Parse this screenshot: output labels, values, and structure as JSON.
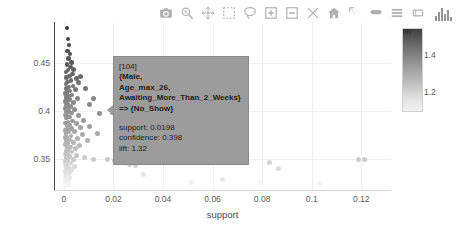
{
  "modebar": {
    "buttons": [
      {
        "name": "download-plot-camera-icon",
        "label": "Download plot as a png"
      },
      {
        "name": "zoom-icon",
        "label": "Zoom"
      },
      {
        "name": "pan-icon",
        "label": "Pan"
      },
      {
        "name": "box-select-icon",
        "label": "Box Select"
      },
      {
        "name": "lasso-select-icon",
        "label": "Lasso Select"
      },
      {
        "name": "zoom-in-icon",
        "label": "Zoom in"
      },
      {
        "name": "zoom-out-icon",
        "label": "Zoom out"
      },
      {
        "name": "autoscale-icon",
        "label": "Autoscale"
      },
      {
        "name": "reset-axes-home-icon",
        "label": "Reset axes"
      },
      {
        "name": "toggle-spike-lines-icon",
        "label": "Toggle Spike Lines"
      },
      {
        "name": "hover-closest-icon",
        "label": "Show closest data on hover"
      },
      {
        "name": "hover-compare-icon",
        "label": "Compare data on hover"
      },
      {
        "name": "toggle-drag-icon",
        "label": "Toggle drag"
      }
    ],
    "logo_label": "Produced with Plotly"
  },
  "tooltip": {
    "id": "[104]",
    "rule_lines": [
      "{Male,",
      "Age_max_26,",
      "Awaiting_More_Than_2_Weeks}",
      "=> {No_Show}"
    ],
    "stats": [
      "support: 0.0198",
      "confidence: 0.398",
      "lift: 1.32"
    ]
  },
  "chart_data": {
    "type": "scatter",
    "title": "",
    "xlabel": "support",
    "ylabel": "confidence",
    "xlim": [
      -0.004,
      0.132
    ],
    "ylim": [
      0.318,
      0.492
    ],
    "xticks": [
      "0",
      "0.02",
      "0.04",
      "0.06",
      "0.08",
      "0.1",
      "0.12"
    ],
    "xtickvals": [
      0,
      0.02,
      0.04,
      0.06,
      0.08,
      0.1,
      0.12
    ],
    "yticks": [
      "0.45",
      "0.4",
      "0.35"
    ],
    "ytickvals": [
      0.45,
      0.4,
      0.35
    ],
    "grid": true,
    "colorbar": {
      "title": "lift",
      "ticks": [
        "1.4",
        "1.2"
      ],
      "tickvals": [
        1.4,
        1.2
      ],
      "min": 1.1,
      "max": 1.55,
      "colorscale": "grey-dark-to-light"
    },
    "legend_position": "none",
    "color_by": "lift",
    "highlighted_point": {
      "support": 0.0198,
      "confidence": 0.398,
      "lift": 1.32
    },
    "points": [
      {
        "x": 0.0012,
        "y": 0.4855,
        "lift": 1.52
      },
      {
        "x": 0.0016,
        "y": 0.4745,
        "lift": 1.5
      },
      {
        "x": 0.002,
        "y": 0.468,
        "lift": 1.49
      },
      {
        "x": 0.0014,
        "y": 0.462,
        "lift": 1.48
      },
      {
        "x": 0.0024,
        "y": 0.459,
        "lift": 1.47
      },
      {
        "x": 0.0018,
        "y": 0.454,
        "lift": 1.46
      },
      {
        "x": 0.003,
        "y": 0.45,
        "lift": 1.45
      },
      {
        "x": 0.0013,
        "y": 0.448,
        "lift": 1.45
      },
      {
        "x": 0.0026,
        "y": 0.4455,
        "lift": 1.44
      },
      {
        "x": 0.004,
        "y": 0.443,
        "lift": 1.43
      },
      {
        "x": 0.0017,
        "y": 0.442,
        "lift": 1.43
      },
      {
        "x": 0.0009,
        "y": 0.44,
        "lift": 1.43
      },
      {
        "x": 0.0034,
        "y": 0.438,
        "lift": 1.42
      },
      {
        "x": 0.0022,
        "y": 0.436,
        "lift": 1.42
      },
      {
        "x": 0.0011,
        "y": 0.4345,
        "lift": 1.41
      },
      {
        "x": 0.005,
        "y": 0.433,
        "lift": 1.41
      },
      {
        "x": 0.0028,
        "y": 0.4315,
        "lift": 1.4
      },
      {
        "x": 0.0015,
        "y": 0.43,
        "lift": 1.4
      },
      {
        "x": 0.006,
        "y": 0.429,
        "lift": 1.39
      },
      {
        "x": 0.0008,
        "y": 0.4275,
        "lift": 1.39
      },
      {
        "x": 0.0037,
        "y": 0.426,
        "lift": 1.39
      },
      {
        "x": 0.002,
        "y": 0.4245,
        "lift": 1.38
      },
      {
        "x": 0.001,
        "y": 0.423,
        "lift": 1.38
      },
      {
        "x": 0.0046,
        "y": 0.422,
        "lift": 1.38
      },
      {
        "x": 0.0025,
        "y": 0.4205,
        "lift": 1.37
      },
      {
        "x": 0.0013,
        "y": 0.419,
        "lift": 1.37
      },
      {
        "x": 0.0007,
        "y": 0.418,
        "lift": 1.37
      },
      {
        "x": 0.0032,
        "y": 0.4165,
        "lift": 1.36
      },
      {
        "x": 0.0018,
        "y": 0.415,
        "lift": 1.36
      },
      {
        "x": 0.0009,
        "y": 0.414,
        "lift": 1.36
      },
      {
        "x": 0.0055,
        "y": 0.413,
        "lift": 1.35
      },
      {
        "x": 0.0023,
        "y": 0.4118,
        "lift": 1.35
      },
      {
        "x": 0.0012,
        "y": 0.4105,
        "lift": 1.35
      },
      {
        "x": 0.0006,
        "y": 0.4095,
        "lift": 1.35
      },
      {
        "x": 0.0038,
        "y": 0.4085,
        "lift": 1.34
      },
      {
        "x": 0.0016,
        "y": 0.4072,
        "lift": 1.34
      },
      {
        "x": 0.0088,
        "y": 0.423,
        "lift": 1.38
      },
      {
        "x": 0.0068,
        "y": 0.4355,
        "lift": 1.41
      },
      {
        "x": 0.012,
        "y": 0.4125,
        "lift": 1.35
      },
      {
        "x": 0.0102,
        "y": 0.4065,
        "lift": 1.34
      },
      {
        "x": 0.0008,
        "y": 0.4058,
        "lift": 1.34
      },
      {
        "x": 0.0027,
        "y": 0.4045,
        "lift": 1.33
      },
      {
        "x": 0.0014,
        "y": 0.4035,
        "lift": 1.33
      },
      {
        "x": 0.0006,
        "y": 0.4025,
        "lift": 1.33
      },
      {
        "x": 0.0044,
        "y": 0.4015,
        "lift": 1.33
      },
      {
        "x": 0.0019,
        "y": 0.4005,
        "lift": 1.32
      },
      {
        "x": 0.001,
        "y": 0.3995,
        "lift": 1.32
      },
      {
        "x": 0.0198,
        "y": 0.398,
        "lift": 1.32
      },
      {
        "x": 0.003,
        "y": 0.3975,
        "lift": 1.32
      },
      {
        "x": 0.0013,
        "y": 0.3965,
        "lift": 1.32
      },
      {
        "x": 0.0005,
        "y": 0.3958,
        "lift": 1.31
      },
      {
        "x": 0.006,
        "y": 0.3948,
        "lift": 1.31
      },
      {
        "x": 0.0022,
        "y": 0.3938,
        "lift": 1.31
      },
      {
        "x": 0.0011,
        "y": 0.3928,
        "lift": 1.31
      },
      {
        "x": 0.0145,
        "y": 0.3975,
        "lift": 1.32
      },
      {
        "x": 0.008,
        "y": 0.3905,
        "lift": 1.3
      },
      {
        "x": 0.0035,
        "y": 0.3895,
        "lift": 1.3
      },
      {
        "x": 0.0016,
        "y": 0.3885,
        "lift": 1.3
      },
      {
        "x": 0.0007,
        "y": 0.3875,
        "lift": 1.3
      },
      {
        "x": 0.005,
        "y": 0.3865,
        "lift": 1.29
      },
      {
        "x": 0.0024,
        "y": 0.3855,
        "lift": 1.29
      },
      {
        "x": 0.0012,
        "y": 0.3845,
        "lift": 1.29
      },
      {
        "x": 0.0105,
        "y": 0.3838,
        "lift": 1.29
      },
      {
        "x": 0.0066,
        "y": 0.3828,
        "lift": 1.28
      },
      {
        "x": 0.0031,
        "y": 0.3818,
        "lift": 1.28
      },
      {
        "x": 0.0015,
        "y": 0.3808,
        "lift": 1.28
      },
      {
        "x": 0.0006,
        "y": 0.3798,
        "lift": 1.28
      },
      {
        "x": 0.0043,
        "y": 0.3788,
        "lift": 1.27
      },
      {
        "x": 0.002,
        "y": 0.3778,
        "lift": 1.27
      },
      {
        "x": 0.0135,
        "y": 0.377,
        "lift": 1.27
      },
      {
        "x": 0.0009,
        "y": 0.3765,
        "lift": 1.27
      },
      {
        "x": 0.0076,
        "y": 0.3755,
        "lift": 1.26
      },
      {
        "x": 0.0028,
        "y": 0.3742,
        "lift": 1.26
      },
      {
        "x": 0.0013,
        "y": 0.3732,
        "lift": 1.26
      },
      {
        "x": 0.0005,
        "y": 0.3722,
        "lift": 1.26
      },
      {
        "x": 0.0055,
        "y": 0.3712,
        "lift": 1.25
      },
      {
        "x": 0.0023,
        "y": 0.37,
        "lift": 1.25
      },
      {
        "x": 0.0095,
        "y": 0.369,
        "lift": 1.25
      },
      {
        "x": 0.0011,
        "y": 0.3685,
        "lift": 1.25
      },
      {
        "x": 0.0038,
        "y": 0.3672,
        "lift": 1.24
      },
      {
        "x": 0.0017,
        "y": 0.366,
        "lift": 1.24
      },
      {
        "x": 0.0007,
        "y": 0.365,
        "lift": 1.24
      },
      {
        "x": 0.0062,
        "y": 0.364,
        "lift": 1.23
      },
      {
        "x": 0.0026,
        "y": 0.3628,
        "lift": 1.23
      },
      {
        "x": 0.0012,
        "y": 0.3618,
        "lift": 1.23
      },
      {
        "x": 0.0046,
        "y": 0.3605,
        "lift": 1.22
      },
      {
        "x": 0.0019,
        "y": 0.3595,
        "lift": 1.22
      },
      {
        "x": 0.0008,
        "y": 0.3585,
        "lift": 1.22
      },
      {
        "x": 0.0033,
        "y": 0.3572,
        "lift": 1.21
      },
      {
        "x": 0.0014,
        "y": 0.3562,
        "lift": 1.21
      },
      {
        "x": 0.0006,
        "y": 0.3552,
        "lift": 1.21
      },
      {
        "x": 0.0052,
        "y": 0.354,
        "lift": 1.2
      },
      {
        "x": 0.0022,
        "y": 0.3528,
        "lift": 1.2
      },
      {
        "x": 0.001,
        "y": 0.3518,
        "lift": 1.2
      },
      {
        "x": 0.0085,
        "y": 0.3512,
        "lift": 1.19
      },
      {
        "x": 0.012,
        "y": 0.35,
        "lift": 1.19
      },
      {
        "x": 0.004,
        "y": 0.3495,
        "lift": 1.19
      },
      {
        "x": 0.0016,
        "y": 0.3485,
        "lift": 1.19
      },
      {
        "x": 0.0007,
        "y": 0.3475,
        "lift": 1.18
      },
      {
        "x": 0.0175,
        "y": 0.3495,
        "lift": 1.19
      },
      {
        "x": 0.0205,
        "y": 0.3488,
        "lift": 1.18
      },
      {
        "x": 0.024,
        "y": 0.347,
        "lift": 1.18
      },
      {
        "x": 0.0265,
        "y": 0.3448,
        "lift": 1.17
      },
      {
        "x": 0.029,
        "y": 0.3432,
        "lift": 1.17
      },
      {
        "x": 0.119,
        "y": 0.3495,
        "lift": 1.18
      },
      {
        "x": 0.1215,
        "y": 0.35,
        "lift": 1.19
      },
      {
        "x": 0.083,
        "y": 0.3462,
        "lift": 1.17
      },
      {
        "x": 0.0865,
        "y": 0.34,
        "lift": 1.15
      },
      {
        "x": 0.0028,
        "y": 0.3462,
        "lift": 1.17
      },
      {
        "x": 0.0012,
        "y": 0.345,
        "lift": 1.17
      },
      {
        "x": 0.0005,
        "y": 0.344,
        "lift": 1.16
      },
      {
        "x": 0.0044,
        "y": 0.3428,
        "lift": 1.16
      },
      {
        "x": 0.0018,
        "y": 0.3415,
        "lift": 1.16
      },
      {
        "x": 0.0008,
        "y": 0.3405,
        "lift": 1.15
      },
      {
        "x": 0.003,
        "y": 0.3392,
        "lift": 1.15
      },
      {
        "x": 0.0013,
        "y": 0.3382,
        "lift": 1.15
      },
      {
        "x": 0.0006,
        "y": 0.337,
        "lift": 1.14
      },
      {
        "x": 0.0022,
        "y": 0.3358,
        "lift": 1.14
      },
      {
        "x": 0.001,
        "y": 0.3348,
        "lift": 1.14
      },
      {
        "x": 0.032,
        "y": 0.334,
        "lift": 1.13
      },
      {
        "x": 0.0016,
        "y": 0.3332,
        "lift": 1.13
      },
      {
        "x": 0.0007,
        "y": 0.3322,
        "lift": 1.13
      },
      {
        "x": 0.0025,
        "y": 0.331,
        "lift": 1.12
      },
      {
        "x": 0.0011,
        "y": 0.33,
        "lift": 1.12
      },
      {
        "x": 0.064,
        "y": 0.3288,
        "lift": 1.12
      },
      {
        "x": 0.0005,
        "y": 0.3285,
        "lift": 1.11
      },
      {
        "x": 0.0018,
        "y": 0.3272,
        "lift": 1.11
      },
      {
        "x": 0.0515,
        "y": 0.3262,
        "lift": 1.11
      },
      {
        "x": 0.0009,
        "y": 0.3258,
        "lift": 1.11
      },
      {
        "x": 0.0795,
        "y": 0.3255,
        "lift": 1.1
      },
      {
        "x": 0.103,
        "y": 0.325,
        "lift": 1.1
      },
      {
        "x": 0.0014,
        "y": 0.3245,
        "lift": 1.1
      },
      {
        "x": 0.0006,
        "y": 0.3235,
        "lift": 1.1
      },
      {
        "x": 0.002,
        "y": 0.3225,
        "lift": 1.1
      }
    ]
  }
}
